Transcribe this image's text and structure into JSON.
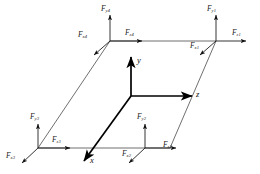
{
  "figure": {
    "type": "force-diagram",
    "background": "#ffffff",
    "line_color": "#3a3a3a",
    "axis_color": "#000000",
    "text_color": "#1a1a1a",
    "width": 260,
    "height": 174
  },
  "axes": {
    "origin_label": "",
    "items": [
      {
        "name": "y",
        "label": "y",
        "direction": "up"
      },
      {
        "name": "z",
        "label": "z",
        "direction": "right"
      },
      {
        "name": "x",
        "label": "x",
        "direction": "down-left"
      }
    ]
  },
  "nodes": [
    {
      "id": "node1",
      "name": "top-right-node",
      "forces": [
        {
          "axis": "y",
          "label": "F",
          "sub": "y1"
        },
        {
          "axis": "z",
          "label": "F",
          "sub": "z1"
        },
        {
          "axis": "x",
          "label": "F",
          "sub": "x1"
        }
      ]
    },
    {
      "id": "node2",
      "name": "bottom-right-node",
      "forces": [
        {
          "axis": "y",
          "label": "F",
          "sub": "y2"
        },
        {
          "axis": "z",
          "label": "F",
          "sub": "z2"
        },
        {
          "axis": "x",
          "label": "F",
          "sub": "x2"
        }
      ]
    },
    {
      "id": "node3",
      "name": "bottom-left-node",
      "forces": [
        {
          "axis": "y",
          "label": "F",
          "sub": "y3"
        },
        {
          "axis": "z",
          "label": "F",
          "sub": "z3"
        },
        {
          "axis": "x",
          "label": "F",
          "sub": "x3"
        }
      ]
    },
    {
      "id": "node4",
      "name": "top-left-node",
      "forces": [
        {
          "axis": "y",
          "label": "F",
          "sub": "y4"
        },
        {
          "axis": "z",
          "label": "F",
          "sub": "z4"
        },
        {
          "axis": "x",
          "label": "F",
          "sub": "x4"
        }
      ]
    }
  ]
}
